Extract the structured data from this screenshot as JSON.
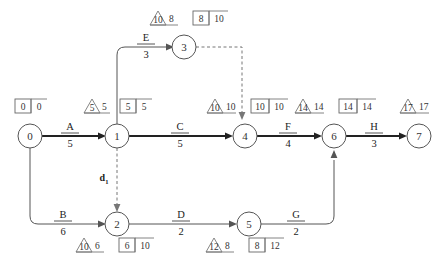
{
  "diagram": {
    "type": "pert-cpm-network",
    "colors": {
      "background": "#ffffff",
      "line": "#555555",
      "critical_path_line": "#222222",
      "dashed_line": "#777777",
      "text": "#333333"
    },
    "nodes": [
      {
        "id": "0",
        "label": "0",
        "x": 30,
        "y": 136
      },
      {
        "id": "1",
        "label": "1",
        "x": 117,
        "y": 136
      },
      {
        "id": "2",
        "label": "2",
        "x": 117,
        "y": 224
      },
      {
        "id": "3",
        "label": "3",
        "x": 184,
        "y": 47
      },
      {
        "id": "4",
        "label": "4",
        "x": 245,
        "y": 136
      },
      {
        "id": "5",
        "label": "5",
        "x": 249,
        "y": 224
      },
      {
        "id": "6",
        "label": "6",
        "x": 334,
        "y": 136
      },
      {
        "id": "7",
        "label": "7",
        "x": 419,
        "y": 136
      }
    ],
    "edges": [
      {
        "name": "A",
        "label": "A",
        "duration": "5",
        "from": "0",
        "to": "1",
        "critical": true,
        "dashed": false
      },
      {
        "name": "B",
        "label": "B",
        "duration": "6",
        "from": "0",
        "to": "2",
        "critical": false,
        "dashed": false
      },
      {
        "name": "C",
        "label": "C",
        "duration": "5",
        "from": "1",
        "to": "4",
        "critical": true,
        "dashed": false
      },
      {
        "name": "D",
        "label": "D",
        "duration": "2",
        "from": "2",
        "to": "5",
        "critical": false,
        "dashed": false
      },
      {
        "name": "E",
        "label": "E",
        "duration": "3",
        "from": "1",
        "to": "3",
        "critical": false,
        "dashed": false
      },
      {
        "name": "F",
        "label": "F",
        "duration": "4",
        "from": "4",
        "to": "6",
        "critical": true,
        "dashed": false
      },
      {
        "name": "G",
        "label": "G",
        "duration": "2",
        "from": "5",
        "to": "6",
        "critical": false,
        "dashed": false
      },
      {
        "name": "H",
        "label": "H",
        "duration": "3",
        "from": "6",
        "to": "7",
        "critical": true,
        "dashed": false
      }
    ],
    "dummy_edges": [
      {
        "name": "d1",
        "label": "d",
        "subscript": "1",
        "from": "1",
        "to": "2",
        "dashed": true
      },
      {
        "name": "d-3-4",
        "label": "",
        "subscript": "",
        "from": "3",
        "to": "4",
        "dashed": true
      }
    ],
    "node_markers": [
      {
        "node": "0",
        "triangle_value": "",
        "triangle_side_value": "",
        "has_triangle": false,
        "box_left": "0",
        "box_right": "0",
        "has_box": true
      },
      {
        "node": "1",
        "triangle_value": "5",
        "triangle_side_value": "5",
        "has_triangle": true,
        "box_left": "5",
        "box_right": "5",
        "has_box": true
      },
      {
        "node": "2",
        "triangle_value": "10",
        "triangle_side_value": "6",
        "has_triangle": true,
        "box_left": "6",
        "box_right": "10",
        "has_box": true
      },
      {
        "node": "3",
        "triangle_value": "10",
        "triangle_side_value": "8",
        "has_triangle": true,
        "box_left": "8",
        "box_right": "10",
        "has_box": true
      },
      {
        "node": "4",
        "triangle_value": "10",
        "triangle_side_value": "10",
        "has_triangle": true,
        "box_left": "10",
        "box_right": "10",
        "has_box": true
      },
      {
        "node": "5",
        "triangle_value": "12",
        "triangle_side_value": "8",
        "has_triangle": true,
        "box_left": "8",
        "box_right": "12",
        "has_box": true
      },
      {
        "node": "6",
        "triangle_value": "14",
        "triangle_side_value": "14",
        "has_triangle": true,
        "box_left": "14",
        "box_right": "14",
        "has_box": true
      },
      {
        "node": "7",
        "triangle_value": "17",
        "triangle_side_value": "17",
        "has_triangle": true,
        "box_left": "",
        "box_right": "",
        "has_box": false
      }
    ]
  }
}
